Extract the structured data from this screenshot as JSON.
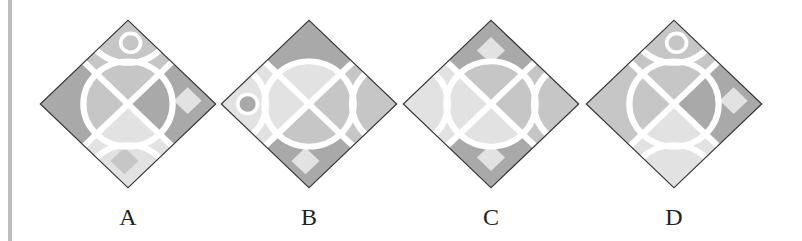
{
  "colors": {
    "dark": "#a9a9a9",
    "mid": "#c6c6c6",
    "light": "#e2e2e2",
    "stroke": "#ffffff",
    "outline": "#333333",
    "bar": "#bdbdbd"
  },
  "options": [
    {
      "label": "A",
      "center_x": 128
    },
    {
      "label": "B",
      "center_x": 309
    },
    {
      "label": "C",
      "center_x": 491
    },
    {
      "label": "D",
      "center_x": 674
    }
  ]
}
